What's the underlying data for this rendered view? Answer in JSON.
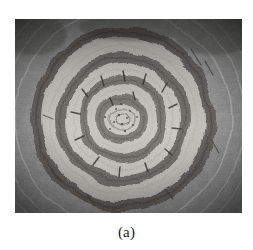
{
  "figure": {
    "caption": "(a)",
    "alt_description": "Grayscale photomicrograph of a concentric banded ring structure",
    "medium": "black-and-white-photograph",
    "frame": {
      "x": 15,
      "y": 19,
      "width": 227,
      "height": 194
    },
    "page_background": "#ffffff",
    "caption_color": "#1b1b1b"
  },
  "image_content": {
    "type": "grayscale-photograph",
    "center": {
      "x": 108,
      "y": 100
    },
    "background_tone": "#8f8f8f",
    "corner_tone": "#5a5a5a",
    "highlight_tone": "#d8d6d0",
    "shadow_tone": "#3a3a3a",
    "grain": "heavy-film-grain",
    "rings": [
      {
        "name": "core-speckled-center",
        "radius": 16,
        "tone": "#cfcdc6",
        "kind": "light"
      },
      {
        "name": "inner-dark-band-1",
        "radius": 25,
        "tone": "#6e6c68",
        "kind": "dark"
      },
      {
        "name": "inner-light-band-1",
        "radius": 34,
        "tone": "#c9c7c0",
        "kind": "light"
      },
      {
        "name": "inner-dark-band-2",
        "radius": 43,
        "tone": "#74726d",
        "kind": "dark"
      },
      {
        "name": "mid-light-band",
        "radius": 55,
        "tone": "#cbc9c2",
        "kind": "light"
      },
      {
        "name": "mid-dark-band",
        "radius": 66,
        "tone": "#6a6864",
        "kind": "dark"
      },
      {
        "name": "outer-light-band",
        "radius": 80,
        "tone": "#c4c2bb",
        "kind": "light"
      },
      {
        "name": "outer-dark-rim",
        "radius": 92,
        "tone": "#5e5c58",
        "kind": "dark"
      }
    ],
    "outer_arcs": [
      {
        "name": "faint-outer-arc-left",
        "radius": 108,
        "tone": "#d5d3cd"
      },
      {
        "name": "faint-outer-arc-right",
        "radius": 122,
        "tone": "#d5d3cd"
      }
    ],
    "features": [
      "scalloped-lobed-outer-boundary",
      "radial-streaks",
      "dark-vignetted-corners",
      "short-dark-radial-marks-on-rings"
    ]
  }
}
